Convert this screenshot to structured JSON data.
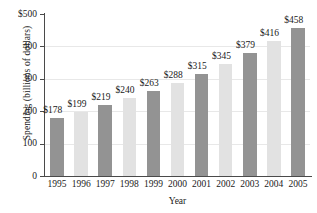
{
  "chart_data": {
    "type": "bar",
    "title": "",
    "xlabel": "Year",
    "ylabel": "Spending (billions of dollars)",
    "categories": [
      "1995",
      "1996",
      "1997",
      "1998",
      "1999",
      "2000",
      "2001",
      "2002",
      "2003",
      "2004",
      "2005"
    ],
    "values": [
      178,
      199,
      219,
      240,
      263,
      288,
      315,
      345,
      379,
      416,
      458
    ],
    "data_labels": [
      "$178",
      "$199",
      "$219",
      "$240",
      "$263",
      "$288",
      "$315",
      "$345",
      "$379",
      "$416",
      "$458"
    ],
    "ylim": [
      0,
      500
    ],
    "ytick_values": [
      0,
      100,
      200,
      300,
      400,
      500
    ],
    "ytick_labels": [
      "0",
      "100",
      "200",
      "300",
      "400",
      "$500"
    ],
    "grid": true,
    "legend": "none",
    "bar_colors": [
      "#939393",
      "#e2e2e2"
    ],
    "bar_color_pattern": "alternating dark-light starting dark"
  }
}
